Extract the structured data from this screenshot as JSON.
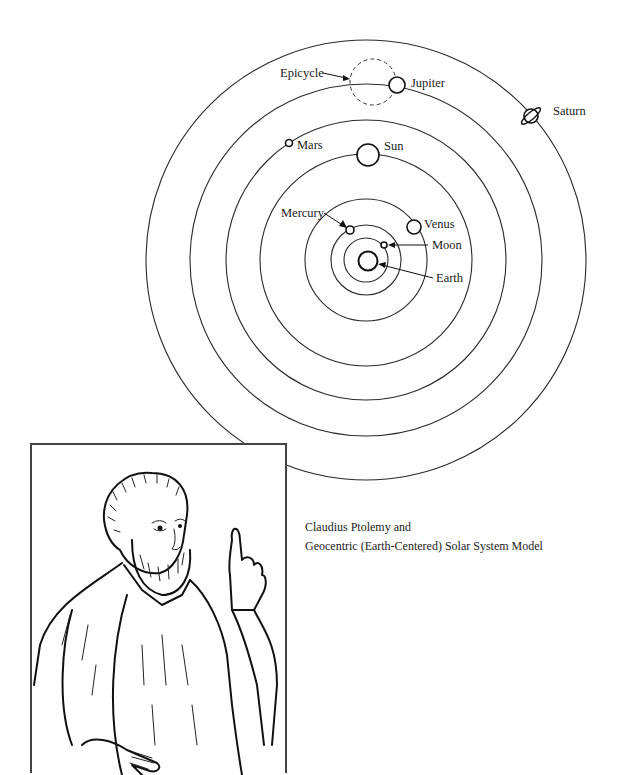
{
  "diagram": {
    "bodies": [
      {
        "id": "earth",
        "label": "Earth"
      },
      {
        "id": "moon",
        "label": "Moon"
      },
      {
        "id": "mercury",
        "label": "Mercury"
      },
      {
        "id": "venus",
        "label": "Venus"
      },
      {
        "id": "sun",
        "label": "Sun"
      },
      {
        "id": "mars",
        "label": "Mars"
      },
      {
        "id": "jupiter",
        "label": "Jupiter"
      },
      {
        "id": "saturn",
        "label": "Saturn"
      }
    ],
    "annotations": {
      "epicycle": "Epicycle"
    }
  },
  "caption": {
    "line1": "Claudius Ptolemy and",
    "line2": "Geocentric (Earth-Centered) Solar System Model"
  },
  "portrait": {
    "subject": "Claudius Ptolemy"
  }
}
